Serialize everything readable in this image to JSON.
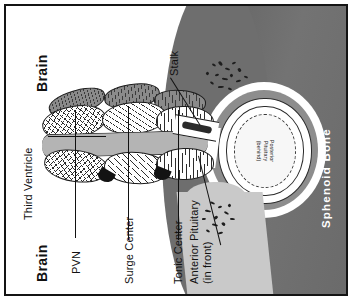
{
  "figure": {
    "labels": {
      "brain_top": "Brain",
      "brain_bottom": "Brain",
      "third_ventricle": "Third Ventricle",
      "pvn": "PVN",
      "surge_center": "Surge Center",
      "tonic_center": "Tonic Center",
      "stalk": "Stalk",
      "anterior_pituitary_line1": "Anterior Pituitary",
      "anterior_pituitary_line2": "(in front)",
      "posterior_pituitary_line1": "Posterior",
      "posterior_pituitary_line2": "Pituitary",
      "posterior_pituitary_line3": "(behind)",
      "sphenoid_bone": "Sphenoid Bone"
    },
    "colors": {
      "frame": "#141414",
      "background": "#ffffff",
      "bone_dark_gray": "#6e6e6e",
      "bone_wall_gray": "#8d8d8d",
      "anterior_pituitary_gray": "#c9c9c9",
      "third_ventricle_gray": "#b4b4b4",
      "ink": "#111111",
      "label_on_bone": "#ffffff"
    },
    "regions": [
      {
        "name": "brain",
        "fill": "white",
        "position": "left"
      },
      {
        "name": "sphenoid-bone",
        "fill": "#6e6e6e",
        "position": "right"
      },
      {
        "name": "sella-turcica",
        "fill": "white",
        "position": "right-center"
      },
      {
        "name": "third-ventricle",
        "fill": "#b4b4b4",
        "position": "center"
      }
    ],
    "nuclei": [
      {
        "name": "PVN",
        "pattern": "cross-hatch"
      },
      {
        "name": "Surge Center",
        "pattern": "diagonal-hatch"
      },
      {
        "name": "Tonic Center",
        "pattern": "vertical-hatch"
      }
    ]
  }
}
